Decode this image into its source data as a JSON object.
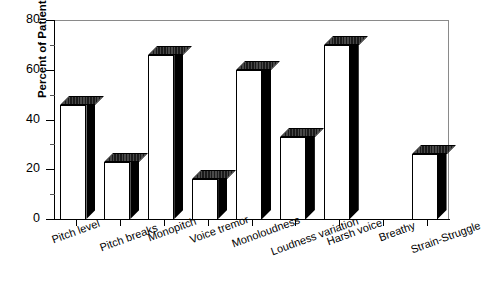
{
  "chart_data": {
    "type": "bar",
    "title": "",
    "xlabel": "",
    "ylabel": "Percent of Patients",
    "categories": [
      "Pitch level",
      "Pitch breaks",
      "Monopitch",
      "Voice tremor",
      "Monoloudness",
      "Loudness variation",
      "Harsh voice",
      "Breathy",
      "Strain-Struggle"
    ],
    "values": [
      46,
      23,
      66,
      16,
      60,
      33,
      70,
      0,
      26
    ],
    "ylim": [
      0,
      80
    ],
    "yticks": [
      0,
      20,
      40,
      60,
      80
    ],
    "ytick_labels": [
      "0",
      "20",
      "40",
      "60",
      "80"
    ],
    "yminor_ticks": [
      10,
      30,
      50,
      70
    ],
    "grid": false,
    "legend": null,
    "bar_style": "3d-block-white-face"
  },
  "axis": {
    "y_title": "Percent of Patients"
  }
}
